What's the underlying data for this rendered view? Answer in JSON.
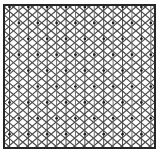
{
  "figure": {
    "type": "lattice-diagram",
    "width": 162,
    "height": 155,
    "background_color": "#ffffff"
  },
  "frame": {
    "name": "outer-border",
    "x": 4,
    "y": 5,
    "width": 151,
    "height": 143,
    "stroke_color": "#262626",
    "stroke_width": 2.0,
    "fill_color": "#ffffff"
  },
  "lattice": {
    "description": "Triangular (isometric) lattice built from vertical lines plus two mirrored diagonal line families",
    "vertical_lines": {
      "name": "vertical-grid-lines",
      "count": 16,
      "spacing": 9.42,
      "first_x": 9.5,
      "stroke_color": "#5a5a5a",
      "stroke_width": 1.0
    },
    "rows": {
      "name": "lattice-rows",
      "count": 9,
      "spacing": 15.9,
      "first_y": 7.0
    },
    "diagonals_down": {
      "name": "diagonal-lines-descending",
      "stroke_color": "#4a4a4a",
      "stroke_width": 1.1
    },
    "diagonals_up": {
      "name": "diagonal-lines-ascending",
      "stroke_color": "#4a4a4a",
      "stroke_width": 1.1
    },
    "nodes": {
      "name": "lattice-nodes",
      "radius": 1.35,
      "fill_color": "#1c1c1c",
      "columns_step": 2
    }
  },
  "colors": {
    "line_dark": "#262626",
    "line_mid": "#4a4a4a",
    "line_light": "#6e6e6e",
    "node": "#1c1c1c",
    "background": "#ffffff"
  }
}
